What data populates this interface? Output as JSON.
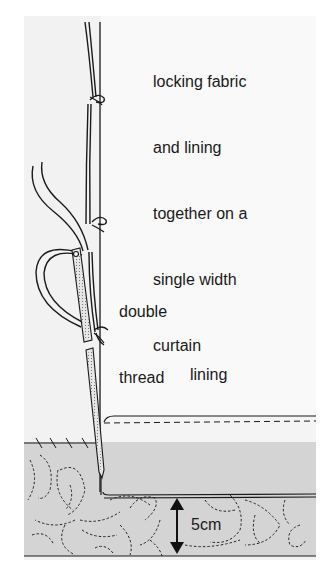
{
  "diagram": {
    "title_lines": [
      "locking fabric",
      "and lining",
      "together on a",
      "single width",
      "curtain"
    ],
    "labels": {
      "thread": [
        "double",
        "thread"
      ],
      "lining": "lining",
      "measurement": "5cm"
    },
    "elements": [
      "curtain-fabric",
      "lining-panel",
      "double-thread",
      "needle",
      "hem-fold",
      "lock-stitch-knots",
      "measurement-arrow"
    ],
    "colors": {
      "background": "#ffffff",
      "panel": "#f2f2f2",
      "lining": "#f7f7f7",
      "fabric": "#d4d4d4",
      "ink": "#1a1a1a"
    }
  }
}
